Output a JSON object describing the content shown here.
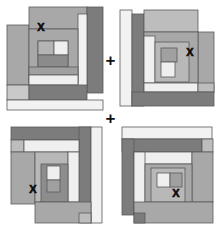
{
  "figure": {
    "name": "log-cabin-quilt-block-arrangement",
    "background": "#ffffff",
    "width": 221,
    "height": 235,
    "operator_label": "+",
    "mark_label": "X"
  },
  "palette": {
    "dark": "#7c7c7c",
    "medium": "#a8a8a8",
    "light": "#d6d6d6",
    "pale": "#ececec",
    "white": "#f7f7f7",
    "outline": "#5a5a5a",
    "mark": "#0d0d0d"
  },
  "operators": [
    {
      "id": "plus-top",
      "label": "+"
    },
    {
      "id": "plus-middle",
      "label": "+"
    }
  ],
  "blocks": [
    {
      "id": "block-top-left",
      "position": "top-left",
      "mark": "X",
      "mark_corner": "upper-left",
      "mark_x": 41,
      "mark_y": 27,
      "pieces": [
        {
          "name": "outer-left-strip",
          "x": 7,
          "y": 25,
          "w": 22,
          "h": 60,
          "fill": "medium"
        },
        {
          "name": "outer-top-strip",
          "x": 29,
          "y": 7,
          "w": 58,
          "h": 22,
          "fill": "medium"
        },
        {
          "name": "outer-right-dark",
          "x": 87,
          "y": 7,
          "w": 16,
          "h": 86,
          "fill": "dark"
        },
        {
          "name": "outer-right-white",
          "x": 78,
          "y": 14,
          "w": 9,
          "h": 72,
          "fill": "white"
        },
        {
          "name": "lower-left-light",
          "x": 7,
          "y": 85,
          "w": 22,
          "h": 15,
          "fill": "light"
        },
        {
          "name": "lower-dark-strip",
          "x": 17,
          "y": 85,
          "w": 70,
          "h": 15,
          "fill": "dark"
        },
        {
          "name": "bottom-white-strip",
          "x": 7,
          "y": 100,
          "w": 96,
          "h": 10,
          "fill": "white"
        },
        {
          "name": "inner-left-medium",
          "x": 29,
          "y": 41,
          "w": 14,
          "h": 41,
          "fill": "medium"
        },
        {
          "name": "inner-body",
          "x": 43,
          "y": 29,
          "w": 35,
          "h": 53,
          "fill": "medium"
        },
        {
          "name": "inner-white-band",
          "x": 29,
          "y": 75,
          "w": 49,
          "h": 8,
          "fill": "white"
        },
        {
          "name": "core-dark",
          "x": 38,
          "y": 55,
          "w": 26,
          "h": 12,
          "fill": "dark"
        },
        {
          "name": "core-light",
          "x": 38,
          "y": 43,
          "w": 16,
          "h": 12,
          "fill": "light"
        },
        {
          "name": "core-white",
          "x": 54,
          "y": 41,
          "w": 13,
          "h": 14,
          "fill": "white"
        }
      ]
    },
    {
      "id": "block-top-right",
      "position": "top-right",
      "mark": "X",
      "mark_corner": "upper-right",
      "mark_x": 79,
      "mark_y": 52,
      "pieces": [
        {
          "name": "outer-left-white",
          "x": 9,
          "y": 10,
          "w": 12,
          "h": 94,
          "fill": "white"
        },
        {
          "name": "outer-left-dark",
          "x": 21,
          "y": 14,
          "w": 12,
          "h": 90,
          "fill": "dark"
        },
        {
          "name": "outer-top-light",
          "x": 33,
          "y": 10,
          "w": 54,
          "h": 22,
          "fill": "light"
        },
        {
          "name": "outer-right-medium",
          "x": 87,
          "y": 32,
          "w": 16,
          "h": 56,
          "fill": "medium"
        },
        {
          "name": "outer-bottom-dark",
          "x": 21,
          "y": 92,
          "w": 82,
          "h": 14,
          "fill": "dark"
        },
        {
          "name": "bottom-white-band",
          "x": 33,
          "y": 83,
          "w": 54,
          "h": 9,
          "fill": "white"
        },
        {
          "name": "bottom-right-light",
          "x": 87,
          "y": 83,
          "w": 16,
          "h": 9,
          "fill": "light"
        },
        {
          "name": "inner-field",
          "x": 33,
          "y": 32,
          "w": 54,
          "h": 51,
          "fill": "medium"
        },
        {
          "name": "inner-white-left",
          "x": 33,
          "y": 36,
          "w": 11,
          "h": 47,
          "fill": "white"
        },
        {
          "name": "core-frame",
          "x": 44,
          "y": 42,
          "w": 34,
          "h": 40,
          "fill": "light"
        },
        {
          "name": "core-medium",
          "x": 50,
          "y": 48,
          "w": 16,
          "h": 14,
          "fill": "medium"
        },
        {
          "name": "core-white",
          "x": 50,
          "y": 62,
          "w": 14,
          "h": 15,
          "fill": "white"
        }
      ]
    },
    {
      "id": "block-bottom-left",
      "position": "bottom-left",
      "mark": "X",
      "mark_corner": "lower-left",
      "mark_x": 33,
      "mark_y": 71,
      "pieces": [
        {
          "name": "outer-top-dark",
          "x": 11,
          "y": 9,
          "w": 80,
          "h": 13,
          "fill": "dark"
        },
        {
          "name": "outer-right-dark",
          "x": 79,
          "y": 9,
          "w": 12,
          "h": 86,
          "fill": "dark"
        },
        {
          "name": "outer-right-white",
          "x": 91,
          "y": 9,
          "w": 11,
          "h": 94,
          "fill": "white"
        },
        {
          "name": "upper-left-light",
          "x": 11,
          "y": 22,
          "w": 13,
          "h": 12,
          "fill": "light"
        },
        {
          "name": "upper-white-band",
          "x": 17,
          "y": 22,
          "w": 62,
          "h": 12,
          "fill": "white"
        },
        {
          "name": "field-left",
          "x": 11,
          "y": 34,
          "w": 24,
          "h": 50,
          "fill": "medium"
        },
        {
          "name": "field-main",
          "x": 35,
          "y": 34,
          "w": 44,
          "h": 50,
          "fill": "light"
        },
        {
          "name": "inner-white-right",
          "x": 68,
          "y": 40,
          "w": 11,
          "h": 44,
          "fill": "white"
        },
        {
          "name": "core-dark",
          "x": 41,
          "y": 46,
          "w": 27,
          "h": 38,
          "fill": "dark"
        },
        {
          "name": "core-white",
          "x": 47,
          "y": 48,
          "w": 13,
          "h": 14,
          "fill": "white"
        },
        {
          "name": "core-medium",
          "x": 47,
          "y": 62,
          "w": 13,
          "h": 12,
          "fill": "medium"
        },
        {
          "name": "bottom-field",
          "x": 35,
          "y": 84,
          "w": 56,
          "h": 21,
          "fill": "medium"
        },
        {
          "name": "bottom-right-light",
          "x": 79,
          "y": 95,
          "w": 12,
          "h": 10,
          "fill": "light"
        }
      ]
    },
    {
      "id": "block-bottom-right",
      "position": "bottom-right",
      "mark": "X",
      "mark_corner": "lower-right",
      "mark_x": 65,
      "mark_y": 75,
      "pieces": [
        {
          "name": "outer-top-white",
          "x": 11,
          "y": 9,
          "w": 90,
          "h": 12,
          "fill": "white"
        },
        {
          "name": "outer-upper-dark",
          "x": 11,
          "y": 21,
          "w": 80,
          "h": 13,
          "fill": "dark"
        },
        {
          "name": "outer-left-dark",
          "x": 11,
          "y": 21,
          "w": 12,
          "h": 74,
          "fill": "dark"
        },
        {
          "name": "outer-right-light",
          "x": 91,
          "y": 21,
          "w": 11,
          "h": 13,
          "fill": "light"
        },
        {
          "name": "inner-white-band",
          "x": 23,
          "y": 34,
          "w": 58,
          "h": 12,
          "fill": "white"
        },
        {
          "name": "inner-left-white",
          "x": 23,
          "y": 34,
          "w": 11,
          "h": 62,
          "fill": "white"
        },
        {
          "name": "field-main",
          "x": 34,
          "y": 46,
          "w": 68,
          "h": 38,
          "fill": "medium"
        },
        {
          "name": "core-light",
          "x": 40,
          "y": 50,
          "w": 34,
          "h": 34,
          "fill": "light"
        },
        {
          "name": "core-white",
          "x": 46,
          "y": 55,
          "w": 13,
          "h": 14,
          "fill": "white"
        },
        {
          "name": "core-medium",
          "x": 59,
          "y": 55,
          "w": 12,
          "h": 14,
          "fill": "medium"
        },
        {
          "name": "bottom-field",
          "x": 23,
          "y": 84,
          "w": 68,
          "h": 21,
          "fill": "medium"
        },
        {
          "name": "bottom-left-dark",
          "x": 23,
          "y": 95,
          "w": 11,
          "h": 10,
          "fill": "dark"
        }
      ]
    }
  ]
}
